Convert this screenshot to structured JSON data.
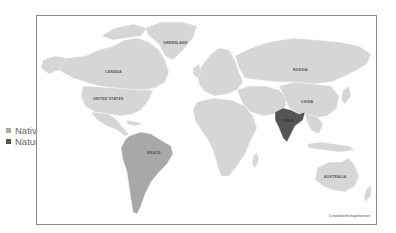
{
  "title": "",
  "legend": {
    "items": [
      {
        "label": "Native",
        "color": "#a8a8a8"
      },
      {
        "label": "Naturalised",
        "color": "#555555"
      }
    ]
  },
  "colors": {
    "default_land": "#d6d6d6",
    "native": "#a8a8a8",
    "naturalised": "#555555",
    "border": "#ffffff",
    "frame": "#8c8c8c"
  },
  "map": {
    "labels": {
      "greenland": "GREENLAND",
      "canada": "CANADA",
      "united_states": "UNITED STATES",
      "russia": "RUSSIA",
      "china": "CHINA",
      "india": "INDIA",
      "brazil": "BRAZIL",
      "australia": "AUSTRALIA"
    },
    "regions": {
      "native": [
        "South America"
      ],
      "naturalised": [
        "India"
      ]
    }
  },
  "credit": "Created with mapchart.net"
}
